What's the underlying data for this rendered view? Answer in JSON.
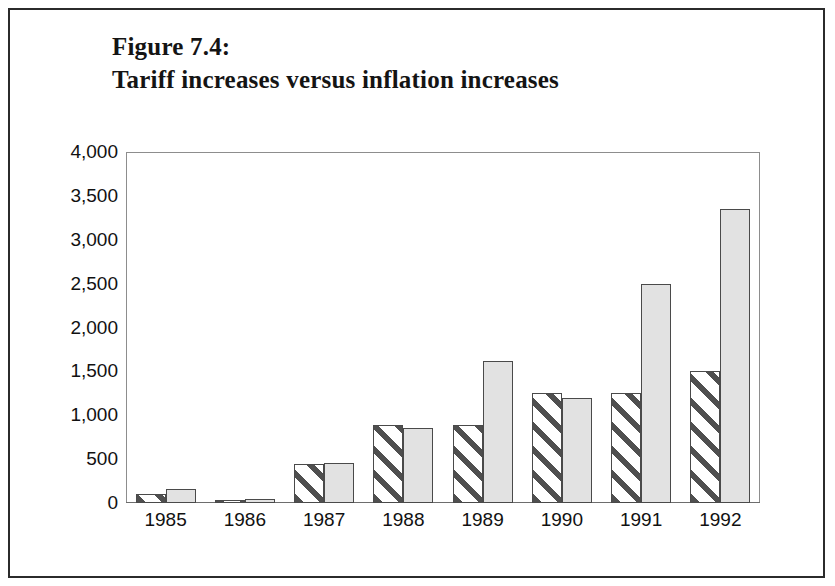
{
  "figure": {
    "title_line1": "Figure 7.4:",
    "title_line2": "Tariff increases versus inflation increases"
  },
  "colors": {
    "frame": "#2b2b2b",
    "plot_border": "#8d8d8d",
    "bar_outline": "#4a4a4a",
    "hatch_line": "#4f4f4f",
    "solid_fill": "#e2e2e2",
    "text": "#111111"
  },
  "chart_data": {
    "type": "bar",
    "title": "Figure 7.4: Tariff increases versus inflation increases",
    "xlabel": "",
    "ylabel": "",
    "categories": [
      "1985",
      "1986",
      "1987",
      "1988",
      "1989",
      "1990",
      "1991",
      "1992"
    ],
    "series": [
      {
        "name": "Tariff increases",
        "pattern": "diagonal-hatch",
        "values": [
          100,
          40,
          440,
          890,
          890,
          1250,
          1250,
          1500
        ]
      },
      {
        "name": "Inflation increases",
        "pattern": "solid-light-gray",
        "values": [
          160,
          50,
          460,
          860,
          1620,
          1200,
          2500,
          3350
        ]
      }
    ],
    "ylim": [
      0,
      4000
    ],
    "ytick_step": 500,
    "yticks": [
      "4,000",
      "3,500",
      "3,000",
      "2,500",
      "2,000",
      "1,500",
      "1,000",
      "500",
      "0"
    ],
    "ytick_values": [
      4000,
      3500,
      3000,
      2500,
      2000,
      1500,
      1000,
      500,
      0
    ],
    "grid": false,
    "legend": "none"
  }
}
